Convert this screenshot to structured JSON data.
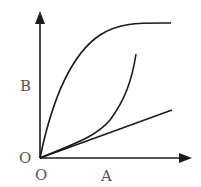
{
  "diagram": {
    "type": "graph-sketch",
    "axes": {
      "x_label": "A",
      "y_label": "B",
      "origin_label_x": "O",
      "origin_label_y": "O"
    },
    "curves": [
      {
        "name": "saturating-curve",
        "shape": "rises steeply then plateaus"
      },
      {
        "name": "accelerating-curve",
        "shape": "starts linear then curves upward"
      },
      {
        "name": "linear-line",
        "shape": "straight line from origin"
      }
    ],
    "colors": {
      "line": "#1a1a1a",
      "text": "#555555",
      "background": "#ffffff"
    }
  }
}
